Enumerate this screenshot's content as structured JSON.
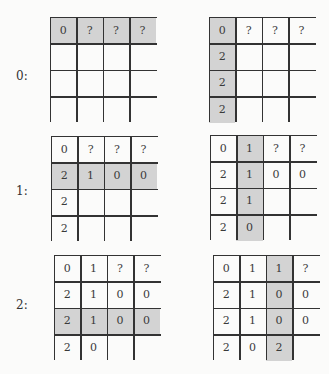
{
  "steps": [
    {
      "label": "0:",
      "label_pos": [
        16,
        69
      ]
    },
    {
      "label": "1:",
      "label_pos": [
        16,
        184
      ]
    },
    {
      "label": "2:",
      "label_pos": [
        16,
        298
      ]
    }
  ],
  "grids": [
    {
      "name": "grid-step0-row-fill",
      "x": 50,
      "y": 17,
      "cells": [
        [
          "0",
          "?",
          "?",
          "?"
        ],
        [
          "",
          "",
          "",
          ""
        ],
        [
          "",
          "",
          "",
          ""
        ],
        [
          "",
          "",
          "",
          ""
        ]
      ],
      "shaded": [
        [
          0,
          0
        ],
        [
          0,
          1
        ],
        [
          0,
          2
        ],
        [
          0,
          3
        ]
      ]
    },
    {
      "name": "grid-step0-col-fill",
      "x": 209,
      "y": 17,
      "cells": [
        [
          "0",
          "?",
          "?",
          "?"
        ],
        [
          "2",
          "",
          "",
          ""
        ],
        [
          "2",
          "",
          "",
          ""
        ],
        [
          "2",
          "",
          "",
          ""
        ]
      ],
      "shaded": [
        [
          0,
          0
        ],
        [
          1,
          0
        ],
        [
          2,
          0
        ],
        [
          3,
          0
        ]
      ]
    },
    {
      "name": "grid-step1-row-fill",
      "x": 51,
      "y": 136,
      "cells": [
        [
          "0",
          "?",
          "?",
          "?"
        ],
        [
          "2",
          "1",
          "0",
          "0"
        ],
        [
          "2",
          "",
          "",
          ""
        ],
        [
          "2",
          "",
          "",
          ""
        ]
      ],
      "shaded": [
        [
          1,
          0
        ],
        [
          1,
          1
        ],
        [
          1,
          2
        ],
        [
          1,
          3
        ]
      ]
    },
    {
      "name": "grid-step1-col-fill",
      "x": 210,
      "y": 135,
      "cells": [
        [
          "0",
          "1",
          "?",
          "?"
        ],
        [
          "2",
          "1",
          "0",
          "0"
        ],
        [
          "2",
          "1",
          "",
          ""
        ],
        [
          "2",
          "0",
          "",
          ""
        ]
      ],
      "shaded": [
        [
          0,
          1
        ],
        [
          1,
          1
        ],
        [
          2,
          1
        ],
        [
          3,
          1
        ]
      ]
    },
    {
      "name": "grid-step2-row-fill",
      "x": 54,
      "y": 255,
      "cells": [
        [
          "0",
          "1",
          "?",
          "?"
        ],
        [
          "2",
          "1",
          "0",
          "0"
        ],
        [
          "2",
          "1",
          "0",
          "0"
        ],
        [
          "2",
          "0",
          "",
          ""
        ]
      ],
      "shaded": [
        [
          2,
          0
        ],
        [
          2,
          1
        ],
        [
          2,
          2
        ],
        [
          2,
          3
        ]
      ]
    },
    {
      "name": "grid-step2-col-fill",
      "x": 213,
      "y": 255,
      "cells": [
        [
          "0",
          "1",
          "1",
          "?"
        ],
        [
          "2",
          "1",
          "0",
          "0"
        ],
        [
          "2",
          "1",
          "0",
          "0"
        ],
        [
          "2",
          "0",
          "2",
          ""
        ]
      ],
      "shaded": [
        [
          0,
          2
        ],
        [
          1,
          2
        ],
        [
          2,
          2
        ],
        [
          3,
          2
        ]
      ]
    }
  ],
  "colors": {
    "shade": "#d3d3d3",
    "line": "#333333",
    "background": "#fbfbfa"
  }
}
